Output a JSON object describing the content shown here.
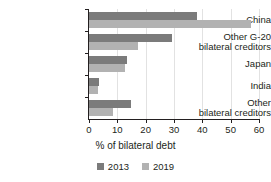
{
  "chart_data": {
    "type": "bar",
    "orientation": "horizontal",
    "title": "",
    "xlabel": "% of bilateral debt",
    "ylabel": "",
    "xlim": [
      0,
      60
    ],
    "xticks": [
      0,
      10,
      20,
      30,
      40,
      50,
      60
    ],
    "grid": true,
    "grid_axis": "x",
    "legend_position": "bottom",
    "categories": [
      "China",
      "Other G-20\nbilateral creditors",
      "Japan",
      "India",
      "Other\nbilateral creditors"
    ],
    "series": [
      {
        "name": "2013",
        "color": "#7b7b7b",
        "values": [
          38.0,
          29.2,
          13.3,
          3.7,
          14.7
        ]
      },
      {
        "name": "2019",
        "color": "#b2b2b2",
        "values": [
          57.2,
          17.3,
          12.8,
          3.2,
          8.5
        ]
      }
    ]
  },
  "axis": {
    "x_title": "% of bilateral debt",
    "tick_labels": [
      "0",
      "10",
      "20",
      "30",
      "40",
      "50",
      "60"
    ]
  },
  "legend": {
    "entries": [
      {
        "label": "2013",
        "swatch_name": "legend-swatch-2013"
      },
      {
        "label": "2019",
        "swatch_name": "legend-swatch-2019"
      }
    ]
  },
  "colors": {
    "series_2013": "#7b7b7b",
    "series_2019": "#b2b2b2",
    "axis": "#231f20",
    "grid": "#e2e2e2",
    "background": "#ffffff"
  }
}
